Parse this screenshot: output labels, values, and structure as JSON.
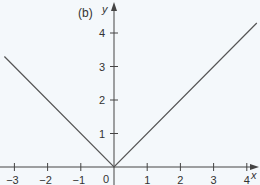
{
  "chart_data": {
    "type": "line",
    "title": "(b)",
    "xlabel": "x",
    "ylabel": "y",
    "function": "y = |x|",
    "xlim": [
      -3.4,
      4.4
    ],
    "ylim": [
      -0.5,
      5.0
    ],
    "grid": false,
    "x_ticks": [
      -3,
      -2,
      -1,
      1,
      2,
      3,
      4
    ],
    "x_tick_labels": [
      "−3",
      "−2",
      "−1",
      "1",
      "2",
      "3",
      "4"
    ],
    "y_ticks": [
      1,
      2,
      3,
      4
    ],
    "y_tick_labels": [
      "1",
      "2",
      "3",
      "4"
    ],
    "origin_label": "0",
    "series": [
      {
        "name": "y = |x|",
        "x": [
          -3.3,
          0,
          4.3
        ],
        "y": [
          3.3,
          0,
          4.3
        ]
      }
    ]
  },
  "colors": {
    "background": "#f4f8fb",
    "axis": "#444444",
    "line": "#555555",
    "text": "#333333"
  }
}
